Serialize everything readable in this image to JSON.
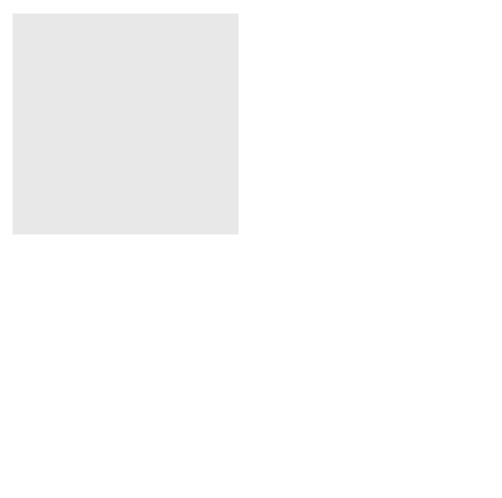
{
  "figure": {
    "background_color": "#e8e8e8",
    "border_color": "#555555",
    "top_panel": {
      "callout_airflow": {
        "lines": [
          "Air flow produced",
          "by pressure gradient"
        ],
        "fill": "#d3d3d3"
      },
      "label_radius_large": "Radius = R",
      "label_radius_small": "Radius = r",
      "alveolus_large": {
        "formula_lhs": "P",
        "formula_lhs_sub": "1",
        "formula_eq": "= 2",
        "formula_num": "δ",
        "formula_den": "R"
      },
      "alveolus_small": {
        "formula_lhs": "P",
        "formula_lhs_sub": "2",
        "formula_eq": "= 2",
        "formula_num": "δ",
        "formula_den": "r"
      },
      "pressure_relation": {
        "left": "P",
        "left_sub": "2",
        "op": ">",
        "right": "P",
        "right_sub": "1"
      },
      "info_box": {
        "lines": [
          "For a constant surface tension",
          "pressure increases as radius decreases"
        ]
      }
    },
    "bottom_panel": {
      "label_no_air_flow": "No air flow",
      "callout_surfactant": {
        "lines": [
          "Surface tension",
          "decreased as surfactant",
          "becomes more tightly packed"
        ],
        "fill": "#9a9a9a"
      },
      "alveolus_large": {
        "formula_lhs": "P",
        "formula_lhs_sub": "1",
        "formula_eq": "= 2",
        "formula_num": "δ",
        "formula_den": "R"
      },
      "alveolus_small": {
        "formula_lhs": "P",
        "formula_lhs_sub": "2",
        "formula_eq": "= 2",
        "formula_num": "δ",
        "formula_den": "r"
      },
      "pressure_relation": {
        "left": "P",
        "left_sub": "2",
        "op": "≈",
        "right": "P",
        "right_sub": "1"
      },
      "info_box": {
        "lines": [
          "The presence of surfactant makes",
          "surface tension depend on radius",
          "and permits stability"
        ]
      }
    },
    "colors": {
      "airway_fill": "#8c8c8c",
      "airway_stroke": "#333333",
      "alveolus_fill": "#c8c8c8",
      "alveolus_stroke": "#333333",
      "info_box_fill": "#efefef"
    }
  }
}
